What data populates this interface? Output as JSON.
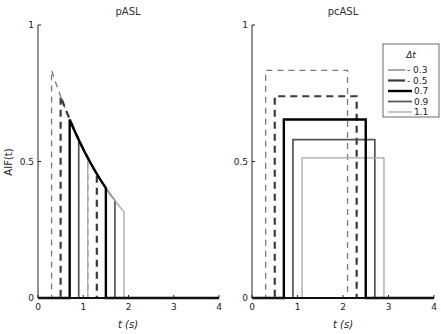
{
  "chart_data": [
    {
      "type": "line",
      "title": "pASL",
      "xlabel": "t (s)",
      "ylabel": "AIF(t)",
      "xlim": [
        0,
        4
      ],
      "ylim": [
        0,
        1
      ],
      "xticks": [
        "0",
        "1",
        "2",
        "3",
        "4"
      ],
      "yticks": [
        "0",
        "0.5",
        "1"
      ],
      "series": [
        {
          "name": "0.3",
          "points": [
            [
              0,
              0
            ],
            [
              0.3,
              0
            ],
            [
              0.3,
              0.834
            ],
            [
              1.1,
              0.513
            ],
            [
              1.1,
              0
            ],
            [
              4,
              0
            ]
          ]
        },
        {
          "name": "0.5",
          "points": [
            [
              0,
              0
            ],
            [
              0.5,
              0
            ],
            [
              0.5,
              0.739
            ],
            [
              1.3,
              0.455
            ],
            [
              1.3,
              0
            ],
            [
              4,
              0
            ]
          ]
        },
        {
          "name": "0.7",
          "points": [
            [
              0,
              0
            ],
            [
              0.7,
              0
            ],
            [
              0.7,
              0.654
            ],
            [
              1.5,
              0.403
            ],
            [
              1.5,
              0
            ],
            [
              4,
              0
            ]
          ]
        },
        {
          "name": "0.9",
          "points": [
            [
              0,
              0
            ],
            [
              0.9,
              0
            ],
            [
              0.9,
              0.58
            ],
            [
              1.7,
              0.357
            ],
            [
              1.7,
              0
            ],
            [
              4,
              0
            ]
          ]
        },
        {
          "name": "1.1",
          "points": [
            [
              0,
              0
            ],
            [
              1.1,
              0
            ],
            [
              1.1,
              0.513
            ],
            [
              1.9,
              0.316
            ],
            [
              1.9,
              0
            ],
            [
              4,
              0
            ]
          ]
        }
      ],
      "curve": "exponential decay between start and end points"
    },
    {
      "type": "line",
      "title": "pcASL",
      "xlabel": "t (s)",
      "ylabel": "",
      "xlim": [
        0,
        4
      ],
      "ylim": [
        0,
        1
      ],
      "xticks": [
        "0",
        "1",
        "2",
        "3",
        "4"
      ],
      "yticks": [
        "0",
        "0.5",
        "1"
      ],
      "legend_title": "Δt",
      "legend_position": "top-right",
      "series": [
        {
          "name": "0.3",
          "points": [
            [
              0,
              0
            ],
            [
              0.3,
              0
            ],
            [
              0.3,
              0.834
            ],
            [
              2.1,
              0.834
            ],
            [
              2.1,
              0
            ],
            [
              4,
              0
            ]
          ]
        },
        {
          "name": "0.5",
          "points": [
            [
              0,
              0
            ],
            [
              0.5,
              0
            ],
            [
              0.5,
              0.739
            ],
            [
              2.3,
              0.739
            ],
            [
              2.3,
              0
            ],
            [
              4,
              0
            ]
          ]
        },
        {
          "name": "0.7",
          "points": [
            [
              0,
              0
            ],
            [
              0.7,
              0
            ],
            [
              0.7,
              0.654
            ],
            [
              2.5,
              0.654
            ],
            [
              2.5,
              0
            ],
            [
              4,
              0
            ]
          ]
        },
        {
          "name": "0.9",
          "points": [
            [
              0,
              0
            ],
            [
              0.9,
              0
            ],
            [
              0.9,
              0.58
            ],
            [
              2.7,
              0.58
            ],
            [
              2.7,
              0
            ],
            [
              4,
              0
            ]
          ]
        },
        {
          "name": "1.1",
          "points": [
            [
              0,
              0
            ],
            [
              1.1,
              0
            ],
            [
              1.1,
              0.513
            ],
            [
              2.9,
              0.513
            ],
            [
              2.9,
              0
            ],
            [
              4,
              0
            ]
          ]
        }
      ]
    }
  ],
  "styles": [
    {
      "name": "0.3",
      "color": "#7a7a7a",
      "dash": "dashed-thin"
    },
    {
      "name": "0.5",
      "color": "#3a3a3a",
      "dash": "dashed-thick"
    },
    {
      "name": "0.7",
      "color": "#000000",
      "dash": "solid-thick"
    },
    {
      "name": "0.9",
      "color": "#555555",
      "dash": "solid"
    },
    {
      "name": "1.1",
      "color": "#a8a8a8",
      "dash": "solid-thin"
    }
  ]
}
